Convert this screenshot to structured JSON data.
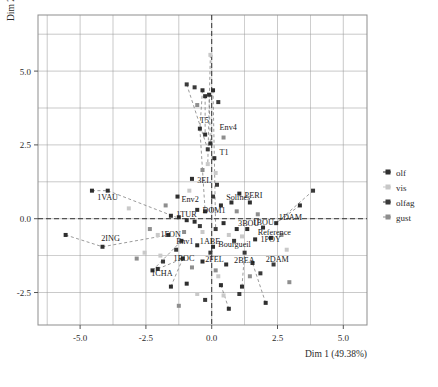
{
  "chart_data": {
    "type": "scatter",
    "title": "",
    "xlabel": "Dim 1 (49.38%)",
    "ylabel": "Dim 2 (19.49%)",
    "xlim": [
      -6.6,
      5.9
    ],
    "ylim": [
      -3.6,
      6.9
    ],
    "xticks": [
      -5.0,
      -2.5,
      0.0,
      2.5,
      5.0
    ],
    "xtick_labels": [
      "-5.0",
      "-2.5",
      "0.0",
      "2.5",
      "5.0"
    ],
    "yticks": [
      5.0,
      2.5,
      0.0,
      -2.5
    ],
    "ytick_labels": [
      "5.0",
      "2.5",
      "0.0",
      "-2.5"
    ],
    "grid": true,
    "grid_color": "#9a9a9a",
    "origin_lines": true,
    "origin_line_style": "dashed",
    "legend_position": "right",
    "legend": [
      {
        "name": "olf",
        "color": "#2f2f2f",
        "marker": "square"
      },
      {
        "name": "vis",
        "color": "#c7c7c7",
        "marker": "square"
      },
      {
        "name": "olfag",
        "color": "#3a3a3a",
        "marker": "square"
      },
      {
        "name": "gust",
        "color": "#8e8e8e",
        "marker": "square"
      }
    ],
    "annotations": [
      {
        "text": "T5",
        "x": -0.45,
        "y": 3.25
      },
      {
        "text": "Env4",
        "x": 0.3,
        "y": 3.0
      },
      {
        "text": "T1",
        "x": 0.3,
        "y": 2.15
      },
      {
        "text": "1VAU",
        "x": -4.35,
        "y": 0.65
      },
      {
        "text": "2ING",
        "x": -4.2,
        "y": -0.75
      },
      {
        "text": "3EL",
        "x": -0.55,
        "y": 1.2
      },
      {
        "text": "Env2",
        "x": -1.15,
        "y": 0.55
      },
      {
        "text": "PERI",
        "x": 1.25,
        "y": 0.7
      },
      {
        "text": "Solines",
        "x": 0.55,
        "y": 0.65
      },
      {
        "text": "DOM1",
        "x": -0.35,
        "y": 0.18
      },
      {
        "text": "1TUR",
        "x": -1.35,
        "y": 0.05
      },
      {
        "text": "3BOU",
        "x": 1.0,
        "y": -0.25
      },
      {
        "text": "1BOU",
        "x": 1.55,
        "y": -0.22
      },
      {
        "text": "1DAM",
        "x": 2.55,
        "y": -0.05
      },
      {
        "text": "Reference",
        "x": 1.75,
        "y": -0.55
      },
      {
        "text": "1POY",
        "x": 1.85,
        "y": -0.8
      },
      {
        "text": "1FON",
        "x": -1.95,
        "y": -0.62
      },
      {
        "text": "Env1",
        "x": -1.35,
        "y": -0.85
      },
      {
        "text": "1ABE",
        "x": -0.45,
        "y": -0.85
      },
      {
        "text": "Bourgueil",
        "x": 0.25,
        "y": -0.95
      },
      {
        "text": "1ROC",
        "x": -1.45,
        "y": -1.42
      },
      {
        "text": "2FEL",
        "x": -0.25,
        "y": -1.45
      },
      {
        "text": "2BEA",
        "x": 0.85,
        "y": -1.5
      },
      {
        "text": "2DAM",
        "x": 2.05,
        "y": -1.45
      },
      {
        "text": "1CHA",
        "x": -2.3,
        "y": -1.95
      }
    ],
    "series": [
      {
        "name": "olf",
        "color": "#2f2f2f",
        "points": [
          [
            -0.35,
            4.35
          ],
          [
            -0.25,
            4.15
          ],
          [
            -0.1,
            4.2
          ],
          [
            0.05,
            4.35
          ],
          [
            -0.45,
            3.05
          ],
          [
            -0.25,
            2.85
          ],
          [
            -0.05,
            2.55
          ],
          [
            0.1,
            2.05
          ],
          [
            -4.55,
            0.95
          ],
          [
            -3.95,
            0.95
          ],
          [
            -4.15,
            -0.95
          ],
          [
            -5.55,
            -0.55
          ],
          [
            -0.75,
            1.35
          ],
          [
            -1.3,
            0.75
          ],
          [
            -0.55,
            0.3
          ],
          [
            -0.25,
            0.25
          ],
          [
            0.35,
            0.45
          ],
          [
            0.75,
            0.55
          ],
          [
            1.05,
            0.85
          ],
          [
            1.45,
            0.55
          ],
          [
            -1.55,
            0.1
          ],
          [
            -1.25,
            0.05
          ],
          [
            -0.95,
            -0.05
          ],
          [
            -0.65,
            -0.1
          ],
          [
            0.45,
            -0.15
          ],
          [
            0.95,
            -0.35
          ],
          [
            1.35,
            -0.35
          ],
          [
            1.95,
            -0.3
          ],
          [
            2.45,
            -0.15
          ],
          [
            3.35,
            0.45
          ],
          [
            2.25,
            -0.65
          ],
          [
            1.65,
            -0.7
          ],
          [
            -1.65,
            -0.55
          ],
          [
            -1.15,
            -0.75
          ],
          [
            -0.55,
            -0.9
          ],
          [
            0.05,
            -0.95
          ],
          [
            -1.1,
            -1.35
          ],
          [
            -0.35,
            -1.45
          ],
          [
            0.55,
            -1.55
          ],
          [
            1.55,
            -1.5
          ],
          [
            -2.05,
            -1.7
          ],
          [
            -2.25,
            -1.75
          ],
          [
            -0.95,
            -2.2
          ],
          [
            0.35,
            -2.25
          ],
          [
            1.15,
            -2.3
          ],
          [
            2.05,
            -2.85
          ],
          [
            -1.55,
            -2.3
          ],
          [
            0.65,
            -3.05
          ]
        ]
      },
      {
        "name": "vis",
        "color": "#c9c9c9",
        "points": [
          [
            -0.05,
            5.55
          ],
          [
            -0.15,
            1.85
          ],
          [
            0.15,
            1.55
          ],
          [
            -2.05,
            -0.55
          ],
          [
            -2.55,
            -1.15
          ],
          [
            -1.95,
            -1.25
          ],
          [
            -0.35,
            -0.45
          ],
          [
            0.65,
            -0.55
          ],
          [
            1.15,
            -0.6
          ],
          [
            0.25,
            -1.95
          ],
          [
            -0.55,
            -2.55
          ],
          [
            0.45,
            -2.6
          ],
          [
            -3.15,
            0.35
          ],
          [
            2.85,
            -1.05
          ],
          [
            -0.85,
            0.95
          ]
        ]
      },
      {
        "name": "olfag",
        "color": "#3a3a3a",
        "points": [
          [
            -0.95,
            4.55
          ],
          [
            -0.65,
            4.45
          ],
          [
            0.25,
            3.95
          ],
          [
            -0.15,
            2.35
          ],
          [
            0.2,
            1.15
          ],
          [
            0.05,
            0.75
          ],
          [
            -0.45,
            -0.25
          ],
          [
            0.15,
            -0.35
          ],
          [
            0.85,
            -0.75
          ],
          [
            -1.35,
            -1.05
          ],
          [
            -0.05,
            -1.15
          ],
          [
            1.25,
            -1.15
          ],
          [
            -1.85,
            -1.45
          ],
          [
            1.85,
            -1.85
          ],
          [
            2.35,
            -1.55
          ],
          [
            -0.25,
            -2.75
          ],
          [
            1.05,
            -2.55
          ],
          [
            3.85,
            0.95
          ]
        ]
      },
      {
        "name": "gust",
        "color": "#8e8e8e",
        "points": [
          [
            -0.55,
            3.85
          ],
          [
            0.45,
            2.75
          ],
          [
            -0.35,
            1.65
          ],
          [
            -1.75,
            0.45
          ],
          [
            0.95,
            0.25
          ],
          [
            1.75,
            0.15
          ],
          [
            -2.35,
            -0.35
          ],
          [
            -1.05,
            -0.45
          ],
          [
            2.65,
            -0.55
          ],
          [
            -0.75,
            -1.65
          ],
          [
            0.15,
            -1.75
          ],
          [
            1.45,
            -1.95
          ],
          [
            -2.85,
            -1.35
          ],
          [
            -1.25,
            -2.95
          ],
          [
            2.95,
            -2.15
          ]
        ]
      }
    ],
    "connector_lines": [
      [
        [
          -4.55,
          0.95
        ],
        [
          -3.95,
          0.95
        ]
      ],
      [
        [
          -3.95,
          0.95
        ],
        [
          -1.35,
          0.05
        ]
      ],
      [
        [
          -5.55,
          -0.55
        ],
        [
          -4.15,
          -0.95
        ]
      ],
      [
        [
          -4.15,
          -0.95
        ],
        [
          -1.65,
          -0.55
        ]
      ],
      [
        [
          -0.35,
          4.35
        ],
        [
          -0.45,
          3.05
        ]
      ],
      [
        [
          -0.25,
          4.15
        ],
        [
          -0.25,
          2.85
        ]
      ],
      [
        [
          -0.1,
          4.2
        ],
        [
          -0.05,
          2.55
        ]
      ],
      [
        [
          0.05,
          4.35
        ],
        [
          0.1,
          2.05
        ]
      ],
      [
        [
          -0.95,
          4.55
        ],
        [
          -0.15,
          2.35
        ]
      ],
      [
        [
          -0.05,
          5.55
        ],
        [
          -0.15,
          1.85
        ]
      ],
      [
        [
          -0.45,
          3.05
        ],
        [
          -0.25,
          0.25
        ]
      ],
      [
        [
          0.1,
          2.05
        ],
        [
          0.15,
          -0.35
        ]
      ],
      [
        [
          3.35,
          0.45
        ],
        [
          2.45,
          -0.15
        ]
      ],
      [
        [
          3.85,
          0.95
        ],
        [
          2.45,
          -0.15
        ]
      ],
      [
        [
          -2.25,
          -1.75
        ],
        [
          -1.15,
          -0.75
        ]
      ],
      [
        [
          -2.05,
          -1.7
        ],
        [
          -1.1,
          -1.35
        ]
      ],
      [
        [
          0.65,
          -3.05
        ],
        [
          0.35,
          -2.25
        ]
      ],
      [
        [
          2.05,
          -2.85
        ],
        [
          1.55,
          -1.5
        ]
      ],
      [
        [
          -1.55,
          -2.3
        ],
        [
          -1.1,
          -1.35
        ]
      ],
      [
        [
          1.15,
          -2.3
        ],
        [
          1.25,
          -1.15
        ]
      ]
    ]
  }
}
